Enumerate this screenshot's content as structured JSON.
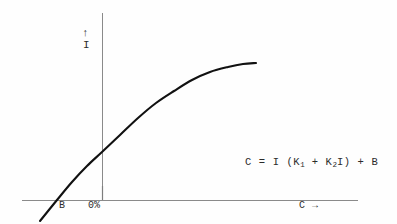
{
  "figure": {
    "background_color": "#fefefe",
    "ink_color": "#1a1a1a",
    "axis_color": "#8a8a8a",
    "curve_color": "#111111"
  },
  "axes": {
    "y_axis_arrow": "↑",
    "y_axis_label": "I",
    "x_axis_label": "C →",
    "x_tick_labels": [
      "B",
      "0%"
    ]
  },
  "equation": {
    "lhs": "C",
    "eq": "=",
    "term_i": "I",
    "open_paren": "(K",
    "sub_1": "1",
    "plus_inner": "+ K",
    "sub_2": "2",
    "term_i2": "I)",
    "plus_outer": "+",
    "term_b": "B",
    "full_text": "C = I (K1 + K2I) + B"
  },
  "chart_data": {
    "type": "line",
    "title": "",
    "xlabel": "C →",
    "ylabel": "I",
    "grid": false,
    "legend": null,
    "annotations": [
      {
        "text": "C = I (K1 + K2I) + B",
        "x_px": 245,
        "y_px": 157
      },
      {
        "text": "B",
        "x_px": 59,
        "y_px": 201
      },
      {
        "text": "0%",
        "x_px": 88,
        "y_px": 201
      }
    ],
    "axis_pixels": {
      "x_axis_y": 200,
      "x_axis_x_start": 22,
      "x_axis_x_end": 358,
      "y_axis_x": 102,
      "y_axis_y_top": 13,
      "y_axis_y_bottom": 200
    },
    "curve_description": "Saturating response curve: linear rise from below the x-axis through the origin region, then bending over to a plateau at the right.",
    "curve_points_px": [
      [
        40,
        221
      ],
      [
        57,
        200
      ],
      [
        72,
        182
      ],
      [
        87,
        166
      ],
      [
        102,
        152
      ],
      [
        120,
        135
      ],
      [
        138,
        118
      ],
      [
        156,
        103
      ],
      [
        174,
        91
      ],
      [
        192,
        80
      ],
      [
        210,
        72
      ],
      [
        228,
        67
      ],
      [
        243,
        64
      ],
      [
        256,
        63
      ]
    ],
    "x_intercept_label": "B",
    "y_axis_origin_label": "0%"
  }
}
